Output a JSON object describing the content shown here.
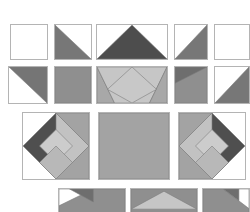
{
  "gallery": {
    "name": "tangram-tile-gallery",
    "width": 250,
    "height": 212,
    "background": "#ffffff",
    "border_color": "#b4b4b4",
    "palette": {
      "white": "#ffffff",
      "dark_grey": "#595959",
      "mid_grey": "#8f8f8f",
      "light_grey": "#c6c6c6",
      "outline": "#b4b4b4",
      "inner_line": "#7d7d7d"
    },
    "rows": [
      {
        "name": "row-1",
        "y": 24,
        "height": 36,
        "tiles": [
          {
            "name": "tile-blank-white",
            "label": "Blank",
            "x": 10,
            "y": 24,
            "w": 38,
            "h": 36,
            "shapes": []
          },
          {
            "name": "tile-triangle-lower-left",
            "label": "Half Dark Lower-Left",
            "x": 54,
            "y": 24,
            "w": 38,
            "h": 36,
            "shapes": [
              {
                "points": "0,0 100,100 0,100",
                "fill": "#777777"
              }
            ]
          },
          {
            "name": "tile-peak-triangle-wide",
            "label": "Centre Peak",
            "x": 96,
            "y": 24,
            "w": 72,
            "h": 36,
            "shapes": [
              {
                "points": "50,0 100,100 0,100",
                "fill": "#4d4d4d"
              }
            ]
          },
          {
            "name": "tile-triangle-upper-right",
            "label": "Half Dark Upper-Right",
            "x": 174,
            "y": 24,
            "w": 34,
            "h": 36,
            "shapes": [
              {
                "points": "100,0 100,100 0,100",
                "fill": "#777777"
              }
            ]
          },
          {
            "name": "tile-blank-white-right",
            "label": "Blank",
            "x": 214,
            "y": 24,
            "w": 36,
            "h": 36,
            "shapes": []
          }
        ]
      },
      {
        "name": "row-2",
        "y": 66,
        "height": 38,
        "tiles": [
          {
            "name": "tile-triangle-right-dark",
            "label": "Half Dark Right",
            "x": 8,
            "y": 66,
            "w": 40,
            "h": 38,
            "shapes": [
              {
                "points": "0,0 100,0 100,100",
                "fill": "#757575"
              }
            ]
          },
          {
            "name": "tile-solid-mid-grey",
            "label": "Solid Mid Grey",
            "x": 54,
            "y": 66,
            "w": 38,
            "h": 38,
            "shapes": [
              {
                "points": "0,0 100,0 100,100 0,100",
                "fill": "#8f8f8f"
              }
            ]
          },
          {
            "name": "tile-tangram-diamond-wide",
            "label": "Diamond Tangram",
            "x": 96,
            "y": 66,
            "w": 72,
            "h": 38,
            "shapes": [
              {
                "points": "0,0 100,0 100,100 0,100",
                "fill": "#8f8f8f"
              },
              {
                "points": "0,0 25,100 0,100",
                "fill": "#a8a8a8"
              },
              {
                "points": "0,0 100,0 75,100 25,100",
                "fill": "#c6c6c6"
              },
              {
                "points": "100,0 100,100 75,100",
                "fill": "#a8a8a8"
              },
              {
                "points": "50,0 85,62 50,100 15,62",
                "fill": "#c8c8c8"
              }
            ]
          },
          {
            "name": "tile-corner-triangle-upper-left",
            "label": "Corner Dark Upper-Left",
            "x": 174,
            "y": 66,
            "w": 34,
            "h": 38,
            "shapes": [
              {
                "points": "0,0 100,0 100,100 0,100",
                "fill": "#8f8f8f"
              },
              {
                "points": "0,0 100,0 0,45",
                "fill": "#6e6e6e"
              }
            ]
          },
          {
            "name": "tile-triangle-right-edge",
            "label": "Half Dark Right Edge",
            "x": 214,
            "y": 66,
            "w": 36,
            "h": 38,
            "shapes": [
              {
                "points": "100,0 100,100 0,100",
                "fill": "#777777"
              }
            ]
          }
        ]
      },
      {
        "name": "row-3",
        "y": 112,
        "height": 68,
        "tiles": [
          {
            "name": "tile-tangram-large-left",
            "label": "Large Tangram Left",
            "x": 22,
            "y": 112,
            "w": 68,
            "h": 68,
            "shapes": [
              {
                "points": "50,0 100,0 100,100 50,100",
                "fill": "#a3a3a3"
              },
              {
                "points": "50,0 100,50 50,100 0,50",
                "fill": "#4f4f4f"
              },
              {
                "points": "50,0 100,50 50,100",
                "fill": "#c2c2c2"
              },
              {
                "points": "50,25 75,50 50,75 25,50",
                "fill": "#cccccc"
              },
              {
                "points": "50,50 75,75 50,100 25,75",
                "fill": "#b8b8b8"
              }
            ]
          },
          {
            "name": "tile-solid-large-centre",
            "label": "Solid Large Grey",
            "x": 98,
            "y": 112,
            "w": 72,
            "h": 68,
            "shapes": [
              {
                "points": "0,0 100,0 100,100 0,100",
                "fill": "#a3a3a3"
              }
            ]
          },
          {
            "name": "tile-tangram-large-right",
            "label": "Large Tangram Right",
            "x": 178,
            "y": 112,
            "w": 68,
            "h": 68,
            "shapes": [
              {
                "points": "0,0 50,0 50,100 0,100",
                "fill": "#a3a3a3"
              },
              {
                "points": "50,0 100,50 50,100 0,50",
                "fill": "#4f4f4f"
              },
              {
                "points": "50,0 50,100 0,50",
                "fill": "#c2c2c2"
              },
              {
                "points": "50,25 75,50 50,75 25,50",
                "fill": "#cccccc"
              },
              {
                "points": "50,50 75,75 50,100 25,75",
                "fill": "#b8b8b8"
              }
            ]
          }
        ]
      },
      {
        "name": "row-4",
        "y": 188,
        "height": 30,
        "tiles": [
          {
            "name": "tile-bottom-corner-left",
            "label": "Bottom Corner Dark",
            "x": 58,
            "y": 188,
            "w": 68,
            "h": 30,
            "shapes": [
              {
                "points": "0,0 100,0 100,100 0,100",
                "fill": "#8f8f8f"
              },
              {
                "points": "0,0 52,0 0,60",
                "fill": "#ffffff"
              },
              {
                "points": "16,0 52,0 52,46",
                "fill": "#6e6e6e"
              }
            ]
          },
          {
            "name": "tile-bottom-peak-centre",
            "label": "Bottom Peak",
            "x": 130,
            "y": 188,
            "w": 68,
            "h": 30,
            "shapes": [
              {
                "points": "0,0 100,0 100,100 0,100",
                "fill": "#8f8f8f"
              },
              {
                "points": "50,8 100,72 0,72",
                "fill": "#c6c6c6"
              }
            ]
          },
          {
            "name": "tile-bottom-corner-right",
            "label": "Bottom Corner Right",
            "x": 202,
            "y": 188,
            "w": 48,
            "h": 30,
            "shapes": [
              {
                "points": "0,0 100,0 100,100 0,100",
                "fill": "#8f8f8f"
              },
              {
                "points": "44,0 100,0 100,70",
                "fill": "#ffffff"
              },
              {
                "points": "44,0 78,0 78,42",
                "fill": "#6e6e6e"
              }
            ]
          }
        ]
      }
    ]
  }
}
